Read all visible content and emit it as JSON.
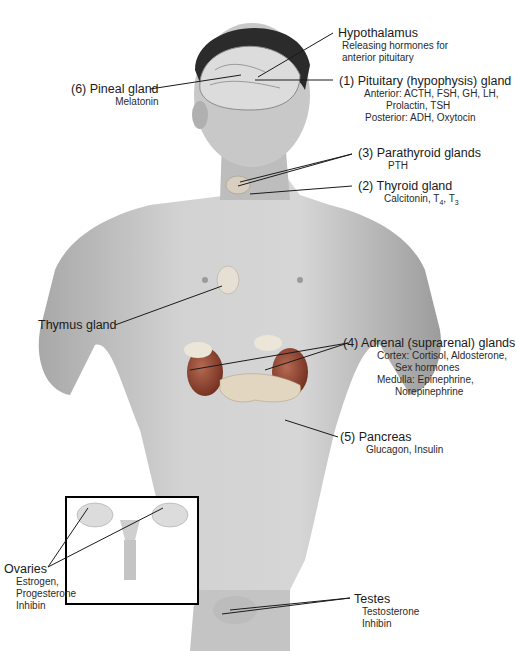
{
  "figure": {
    "labels": {
      "hypothalamus": {
        "title": "Hypothalamus",
        "lines": [
          "Releasing hormones for",
          "anterior pituitary"
        ]
      },
      "pineal": {
        "title": "(6) Pineal gland",
        "lines": [
          "Melatonin"
        ]
      },
      "pituitary": {
        "title": "(1) Pituitary (hypophysis) gland",
        "lines": [
          "Anterior: ACTH, FSH, GH, LH,",
          "Prolactin, TSH",
          "Posterior: ADH, Oxytocin"
        ]
      },
      "parathyroid": {
        "title": "(3) Parathyroid glands",
        "lines": [
          "PTH"
        ]
      },
      "thyroid": {
        "title": "(2) Thyroid gland",
        "lines": [
          "Calcitonin, T4, T3"
        ]
      },
      "thymus": {
        "title": "Thymus gland",
        "lines": []
      },
      "adrenal": {
        "title": "(4) Adrenal (suprarenal) glands",
        "lines": [
          "Cortex: Cortisol, Aldosterone,",
          "Sex hormones",
          "Medulla: Epinephrine,",
          "Norepinephrine"
        ]
      },
      "pancreas": {
        "title": "(5) Pancreas",
        "lines": [
          "Glucagon, Insulin"
        ]
      },
      "ovaries": {
        "title": "Ovaries",
        "lines": [
          "Estrogen,",
          "Progesterone",
          "Inhibin"
        ]
      },
      "testes": {
        "title": "Testes",
        "lines": [
          "Testosterone",
          "Inhibin"
        ]
      }
    },
    "colors": {
      "skin": "#c9c9c9",
      "skin_dark": "#9a9a9a",
      "hair": "#2b2b2b",
      "kidney": "#8a3a2a",
      "gland": "#e8e0d0",
      "line": "#1a1a1a"
    }
  }
}
